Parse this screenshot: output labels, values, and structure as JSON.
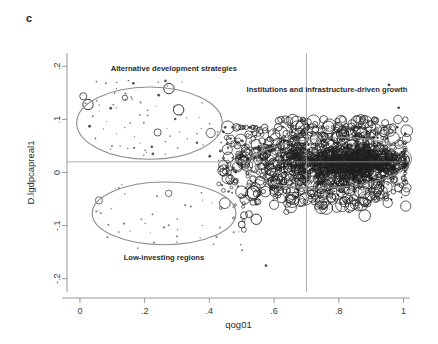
{
  "figure": {
    "panel_label": "c",
    "background_color": "#ffffff"
  },
  "chart_data": {
    "type": "scatter",
    "title": "",
    "subtitle": "",
    "xlabel": "qog01",
    "ylabel": "D.lgdpcapreal1",
    "xlim": [
      -0.04,
      1.02
    ],
    "ylim": [
      -0.225,
      0.225
    ],
    "xticks": [
      0,
      0.2,
      0.4,
      0.6,
      0.8,
      1
    ],
    "xtick_labels": [
      "0",
      ".2",
      ".4",
      ".6",
      ".8",
      "1"
    ],
    "yticks": [
      0.2,
      0.1,
      0,
      -0.1,
      -0.2
    ],
    "ytick_labels": [
      ".2",
      ".1",
      "0",
      "-.1",
      "-.2"
    ],
    "grid": false,
    "legend": false,
    "marker_style": "hollow-circle-variable-size",
    "marker_color": "#1e1e1e",
    "reference_lines": [
      {
        "orientation": "vertical",
        "value": 0.7,
        "color": "#9a9a9a"
      },
      {
        "orientation": "horizontal",
        "value": 0.02,
        "color": "#9a9a9a"
      }
    ],
    "annotations": [
      {
        "text": "Alternative development strategies",
        "x": 0.095,
        "y": 0.192,
        "anchor": "start",
        "group": "upper-left-cluster"
      },
      {
        "text": "Institutions and infrastructure-driven growth",
        "x": 0.515,
        "y": 0.152,
        "anchor": "start",
        "group": "right-dense-cluster"
      },
      {
        "text": "Low-investing regions",
        "x": 0.135,
        "y": -0.165,
        "anchor": "start",
        "group": "lower-left-cluster"
      }
    ],
    "highlight_ellipses": [
      {
        "name": "alternative-development-strategies",
        "cx": 0.215,
        "cy": 0.093,
        "rx": 0.225,
        "ry": 0.068,
        "rotation": 0,
        "color": "#8e8e8e"
      },
      {
        "name": "low-investing-regions",
        "cx": 0.26,
        "cy": -0.077,
        "rx": 0.222,
        "ry": 0.059,
        "rotation": 0,
        "color": "#8e8e8e"
      },
      {
        "name": "institutions-and-infrastructure-driven-growth",
        "cx": 0.77,
        "cy": 0.018,
        "rx": 0.255,
        "ry": 0.047,
        "rotation": -3,
        "color": "#a8a8a8"
      }
    ],
    "clusters": [
      {
        "name": "alternative-development-strategies",
        "n_points": 78,
        "x_range": [
          0.01,
          0.44
        ],
        "y_range": [
          0.025,
          0.175
        ],
        "size_profile": "mostly-small-few-large",
        "description": "Sparse small markers at low qog01 with positive growth"
      },
      {
        "name": "low-investing-regions",
        "n_points": 46,
        "x_range": [
          0.05,
          0.55
        ],
        "y_range": [
          -0.15,
          -0.015
        ],
        "size_profile": "mostly-small",
        "description": "Sparse small markers at low qog01 with negative growth"
      },
      {
        "name": "transition-band",
        "n_points": 420,
        "x_range": [
          0.42,
          0.7
        ],
        "y_range": [
          -0.095,
          0.085
        ],
        "size_profile": "mixed-medium-large",
        "description": "Medium-density bubbles bridging to the main mass"
      },
      {
        "name": "institutions-and-infrastructure-driven-growth",
        "n_points": 2400,
        "x_range": [
          0.62,
          1.0
        ],
        "y_range": [
          -0.055,
          0.065
        ],
        "size_profile": "dense-small-overplotted",
        "description": "Very dense overplotted mass centred near y=0.02"
      }
    ],
    "outliers": [
      {
        "x": 0.575,
        "y": -0.175,
        "size": "small"
      },
      {
        "x": 0.5,
        "y": -0.098,
        "size": "medium"
      },
      {
        "x": 0.545,
        "y": -0.088,
        "size": "large"
      },
      {
        "x": 0.165,
        "y": 0.168,
        "size": "small"
      },
      {
        "x": 0.025,
        "y": 0.128,
        "size": "large"
      },
      {
        "x": 0.275,
        "y": 0.158,
        "size": "large"
      },
      {
        "x": 0.305,
        "y": 0.118,
        "size": "large"
      },
      {
        "x": 0.985,
        "y": 0.122,
        "size": "small"
      },
      {
        "x": 0.955,
        "y": 0.165,
        "size": "small"
      }
    ]
  }
}
